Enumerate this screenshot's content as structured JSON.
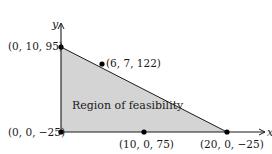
{
  "diagram": {
    "title": "",
    "region_label": "Region of feasibility",
    "region_fill": "#d4d4d4",
    "axes": {
      "x_label": "x",
      "y_label": "y"
    },
    "points": [
      {
        "id": "p1",
        "label": "(0, 10, 95)",
        "coords": [
          0,
          10,
          95
        ]
      },
      {
        "id": "p2",
        "label": "(6, 7, 122)",
        "coords": [
          6,
          7,
          122
        ]
      },
      {
        "id": "p3",
        "label": "(0, 0, −25)",
        "coords": [
          0,
          0,
          -25
        ]
      },
      {
        "id": "p4",
        "label": "(10, 0, 75)",
        "coords": [
          10,
          0,
          75
        ]
      },
      {
        "id": "p5",
        "label": "(20, 0, −25)",
        "coords": [
          20,
          0,
          -25
        ]
      }
    ]
  }
}
